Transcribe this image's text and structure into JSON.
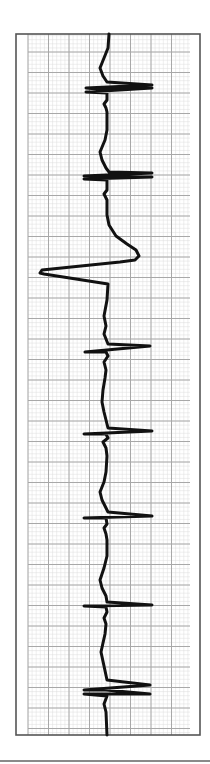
{
  "figure": {
    "type": "ecg-rhythm-strip",
    "orientation": "vertical",
    "paper": {
      "frame": {
        "x": 16,
        "y": 34,
        "width": 184,
        "height": 701,
        "color": "#555555"
      },
      "grid_area": {
        "x": 28,
        "y": 34,
        "width": 162,
        "height": 701
      },
      "minor_spacing": 4.1,
      "major_spacing": 20.5,
      "minor_color": "#dcdcdc",
      "major_color": "#a8a8a8",
      "background": "#ffffff"
    },
    "trace": {
      "color": "#111111",
      "width": 3,
      "points": [
        [
          109,
          34
        ],
        [
          108,
          48
        ],
        [
          104,
          58
        ],
        [
          100,
          68
        ],
        [
          103,
          76
        ],
        [
          107,
          82
        ],
        [
          152,
          85
        ],
        [
          86,
          88
        ],
        [
          108,
          90
        ],
        [
          152,
          88
        ],
        [
          86,
          92
        ],
        [
          107,
          93
        ],
        [
          107,
          100
        ],
        [
          104,
          104
        ],
        [
          106,
          108
        ],
        [
          107,
          112
        ],
        [
          107,
          130
        ],
        [
          105,
          140
        ],
        [
          100,
          152
        ],
        [
          102,
          160
        ],
        [
          106,
          168
        ],
        [
          109,
          172
        ],
        [
          152,
          173
        ],
        [
          84,
          176
        ],
        [
          108,
          177
        ],
        [
          152,
          177
        ],
        [
          84,
          179
        ],
        [
          107,
          180
        ],
        [
          107,
          190
        ],
        [
          104,
          194
        ],
        [
          106,
          198
        ],
        [
          107,
          200
        ],
        [
          107,
          215
        ],
        [
          109,
          225
        ],
        [
          116,
          236
        ],
        [
          127,
          244
        ],
        [
          136,
          250
        ],
        [
          139,
          256
        ],
        [
          135,
          260
        ],
        [
          120,
          262
        ],
        [
          42,
          270
        ],
        [
          40,
          273
        ],
        [
          44,
          274
        ],
        [
          108,
          284
        ],
        [
          107,
          300
        ],
        [
          104,
          316
        ],
        [
          106,
          326
        ],
        [
          104,
          334
        ],
        [
          108,
          344
        ],
        [
          150,
          346
        ],
        [
          85,
          352
        ],
        [
          106,
          352
        ],
        [
          108,
          356
        ],
        [
          104,
          362
        ],
        [
          106,
          370
        ],
        [
          105,
          378
        ],
        [
          103,
          390
        ],
        [
          102,
          402
        ],
        [
          104,
          412
        ],
        [
          107,
          424
        ],
        [
          108,
          428
        ],
        [
          152,
          431
        ],
        [
          84,
          434
        ],
        [
          106,
          434
        ],
        [
          108,
          438
        ],
        [
          103,
          442
        ],
        [
          106,
          448
        ],
        [
          107,
          456
        ],
        [
          106,
          472
        ],
        [
          104,
          482
        ],
        [
          100,
          492
        ],
        [
          102,
          500
        ],
        [
          106,
          508
        ],
        [
          108,
          512
        ],
        [
          152,
          516
        ],
        [
          84,
          518
        ],
        [
          106,
          518
        ],
        [
          107,
          524
        ],
        [
          104,
          528
        ],
        [
          106,
          534
        ],
        [
          107,
          540
        ],
        [
          107,
          556
        ],
        [
          104,
          568
        ],
        [
          100,
          580
        ],
        [
          102,
          588
        ],
        [
          106,
          596
        ],
        [
          107,
          602
        ],
        [
          152,
          605
        ],
        [
          84,
          606
        ],
        [
          106,
          607
        ],
        [
          107,
          612
        ],
        [
          104,
          618
        ],
        [
          106,
          624
        ],
        [
          105,
          634
        ],
        [
          101,
          652
        ],
        [
          104,
          666
        ],
        [
          107,
          680
        ],
        [
          150,
          685
        ],
        [
          84,
          690
        ],
        [
          106,
          690
        ],
        [
          150,
          694
        ],
        [
          84,
          694
        ],
        [
          107,
          696
        ],
        [
          104,
          704
        ],
        [
          106,
          712
        ],
        [
          107,
          735
        ]
      ]
    },
    "baseline_rule": {
      "y": 761,
      "x1": 0,
      "x2": 210,
      "color": "#8a8a8a"
    }
  }
}
